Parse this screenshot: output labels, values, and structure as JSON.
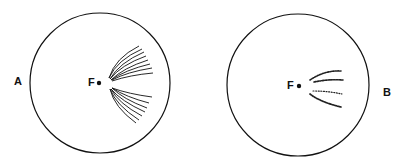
{
  "panels": [
    {
      "label": "A",
      "focus_label": "F",
      "description": "Continuous curved lines fanning out from near focus F toward the right"
    },
    {
      "label": "B",
      "focus_label": "F",
      "description": "Dotted/broken curved streaks to the right of focus F"
    }
  ],
  "colors": {
    "stroke": "#111111",
    "background": "#ffffff"
  }
}
